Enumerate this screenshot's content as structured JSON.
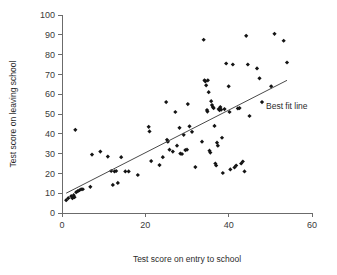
{
  "chart_data": {
    "type": "scatter",
    "title": "",
    "xlabel": "Test score on entry to school",
    "ylabel": "Test score on leaving school",
    "xlim": [
      0,
      60
    ],
    "ylim": [
      0,
      100
    ],
    "xticks": [
      0,
      20,
      40,
      60
    ],
    "yticks": [
      0,
      10,
      20,
      30,
      40,
      50,
      60,
      70,
      80,
      90,
      100
    ],
    "grid": false,
    "legend_position": "none",
    "annotations": [
      {
        "text": "Best fit line",
        "x": 47.5,
        "y": 56
      }
    ],
    "series": [
      {
        "name": "Pupils",
        "marker": "diamond",
        "color": "#141414",
        "points": [
          [
            1.0,
            6.5
          ],
          [
            1.5,
            7.5
          ],
          [
            2.2,
            8.5
          ],
          [
            2.5,
            7.5
          ],
          [
            2.8,
            9.0
          ],
          [
            3.0,
            8.0
          ],
          [
            3.2,
            42.0
          ],
          [
            3.4,
            10.5
          ],
          [
            3.8,
            11.0
          ],
          [
            4.2,
            11.5
          ],
          [
            4.6,
            12.0
          ],
          [
            5.0,
            12.0
          ],
          [
            6.8,
            13.2
          ],
          [
            7.2,
            29.5
          ],
          [
            9.2,
            31.0
          ],
          [
            11.0,
            28.5
          ],
          [
            11.8,
            21.2
          ],
          [
            12.2,
            14.2
          ],
          [
            12.6,
            21.0
          ],
          [
            13.0,
            21.2
          ],
          [
            13.4,
            15.2
          ],
          [
            14.2,
            28.2
          ],
          [
            15.2,
            21.0
          ],
          [
            16.0,
            21.0
          ],
          [
            18.2,
            19.2
          ],
          [
            20.8,
            43.5
          ],
          [
            21.0,
            41.2
          ],
          [
            21.4,
            26.2
          ],
          [
            23.4,
            24.2
          ],
          [
            24.2,
            28.2
          ],
          [
            25.0,
            56.0
          ],
          [
            25.2,
            37.0
          ],
          [
            25.4,
            36.0
          ],
          [
            25.8,
            32.0
          ],
          [
            26.6,
            31.0
          ],
          [
            27.2,
            51.0
          ],
          [
            27.6,
            34.0
          ],
          [
            28.2,
            43.0
          ],
          [
            28.4,
            30.0
          ],
          [
            28.8,
            29.8
          ],
          [
            29.2,
            39.5
          ],
          [
            29.6,
            31.8
          ],
          [
            30.0,
            32.0
          ],
          [
            30.2,
            55.0
          ],
          [
            30.6,
            43.8
          ],
          [
            31.2,
            41.0
          ],
          [
            32.0,
            23.2
          ],
          [
            33.6,
            36.0
          ],
          [
            34.0,
            87.5
          ],
          [
            34.2,
            67.0
          ],
          [
            34.4,
            66.5
          ],
          [
            34.6,
            64.5
          ],
          [
            34.8,
            52.0
          ],
          [
            34.9,
            51.2
          ],
          [
            35.0,
            67.0
          ],
          [
            35.2,
            61.0
          ],
          [
            35.4,
            31.5
          ],
          [
            35.6,
            30.5
          ],
          [
            35.8,
            56.5
          ],
          [
            36.0,
            54.5
          ],
          [
            36.2,
            53.5
          ],
          [
            36.4,
            53.0
          ],
          [
            36.6,
            44.0
          ],
          [
            36.8,
            25.0
          ],
          [
            37.0,
            24.0
          ],
          [
            37.2,
            35.5
          ],
          [
            37.4,
            34.0
          ],
          [
            37.6,
            52.5
          ],
          [
            37.8,
            52.0
          ],
          [
            38.0,
            53.5
          ],
          [
            38.2,
            52.2
          ],
          [
            38.4,
            38.0
          ],
          [
            38.6,
            20.2
          ],
          [
            39.0,
            52.5
          ],
          [
            39.4,
            75.5
          ],
          [
            40.0,
            64.0
          ],
          [
            40.2,
            51.0
          ],
          [
            40.4,
            22.0
          ],
          [
            41.0,
            75.0
          ],
          [
            41.4,
            23.0
          ],
          [
            41.8,
            24.0
          ],
          [
            42.2,
            52.8
          ],
          [
            42.6,
            53.0
          ],
          [
            43.0,
            25.0
          ],
          [
            43.4,
            26.0
          ],
          [
            43.8,
            21.0
          ],
          [
            44.2,
            89.5
          ],
          [
            44.6,
            75.0
          ],
          [
            45.0,
            49.0
          ],
          [
            46.8,
            73.0
          ],
          [
            47.4,
            68.0
          ],
          [
            48.0,
            56.0
          ],
          [
            50.2,
            64.0
          ],
          [
            51.0,
            90.5
          ],
          [
            53.2,
            87.0
          ],
          [
            54.0,
            76.0
          ]
        ]
      }
    ],
    "fit_line": {
      "label": "Best fit line",
      "x0": 1.0,
      "y0": 10.0,
      "x1": 54.0,
      "y1": 67.0
    }
  }
}
